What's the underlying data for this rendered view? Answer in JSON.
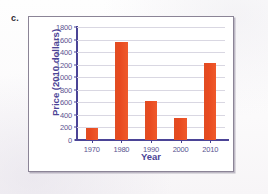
{
  "part_label": "c.",
  "colors": {
    "bar": "#E8491F",
    "axis": "#4B4496",
    "tick_text": "#5A5490",
    "grid": "#D9D7E2",
    "panel_border": "#8B8496"
  },
  "chart_data": {
    "type": "bar",
    "title": "",
    "xlabel": "Year",
    "ylabel": "Price (2010 dollars)",
    "categories": [
      "1970",
      "1980",
      "1990",
      "2000",
      "2010"
    ],
    "values": [
      190,
      1560,
      625,
      350,
      1220
    ],
    "ylim": [
      0,
      1800
    ],
    "yticks": [
      0,
      200,
      400,
      600,
      800,
      1000,
      1200,
      1400,
      1600,
      1800
    ],
    "ytick_labels": [
      "0",
      "200",
      "400",
      "600",
      "800",
      "1000",
      "1200",
      "1400",
      "1600",
      "1800"
    ],
    "grid": true,
    "legend": null,
    "series": [
      {
        "name": "Price (2010 dollars)",
        "values": [
          190,
          1560,
          625,
          350,
          1220
        ]
      }
    ]
  }
}
